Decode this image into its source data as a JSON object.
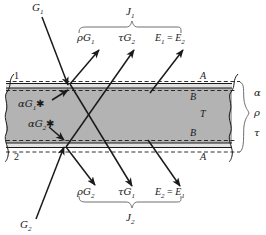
{
  "figure": {
    "type": "physics-schematic",
    "background_color": "#ffffff",
    "slab_fill_color": "#b3b3b3",
    "line_color": "#1a1a1a"
  },
  "incident": {
    "top_source": "G",
    "top_source_sub": "1",
    "bottom_source": "G",
    "bottom_source_sub": "2"
  },
  "top_flux_group": {
    "brace_label": "J",
    "brace_label_sub": "1",
    "items": [
      {
        "symbol": "ρG",
        "sub": "1"
      },
      {
        "symbol": "τG",
        "sub": "2"
      },
      {
        "symbol": "E",
        "sub": "1",
        "equals": "=",
        "symbol2": "E",
        "sub2": "2"
      }
    ]
  },
  "bottom_flux_group": {
    "brace_label": "J",
    "brace_label_sub": "2",
    "items": [
      {
        "symbol": "ρG",
        "sub": "2"
      },
      {
        "symbol": "τG",
        "sub": "1"
      },
      {
        "symbol": "E",
        "sub": "2",
        "equals": "=",
        "symbol2": "E",
        "sub2": "1"
      }
    ]
  },
  "absorption_labels": [
    {
      "symbol": "αG",
      "sub": "1",
      "star": "✱"
    },
    {
      "symbol": "αG",
      "sub": "2",
      "star": "✱"
    }
  ],
  "surface_labels": {
    "left_top": "1",
    "left_bottom": "2"
  },
  "layer_labels": {
    "top_outer": "A",
    "top_inner": "B",
    "core": "T",
    "bottom_inner": "B",
    "bottom_outer": "A"
  },
  "property_brace": {
    "items": [
      "α",
      "ρ",
      "τ"
    ]
  }
}
